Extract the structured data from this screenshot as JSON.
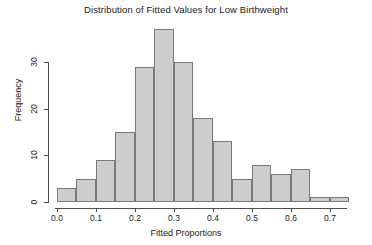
{
  "chart_data": {
    "type": "bar",
    "title": "Distribution of Fitted Values for Low Birthweight",
    "xlabel": "Fitted Proportions",
    "ylabel": "Frequency",
    "xlim": [
      0.0,
      0.7385
    ],
    "ylim": [
      0,
      37
    ],
    "grid": false,
    "legend": null,
    "bin_width": 0.05,
    "bin_edges": [
      0.0,
      0.05,
      0.1,
      0.15,
      0.2,
      0.25,
      0.3,
      0.35,
      0.4,
      0.45,
      0.5,
      0.55,
      0.6,
      0.65,
      0.7,
      0.75
    ],
    "categories": [
      "0.00-0.05",
      "0.05-0.10",
      "0.10-0.15",
      "0.15-0.20",
      "0.20-0.25",
      "0.25-0.30",
      "0.30-0.35",
      "0.35-0.40",
      "0.40-0.45",
      "0.45-0.50",
      "0.50-0.55",
      "0.55-0.60",
      "0.60-0.65",
      "0.65-0.70",
      "0.70-0.75"
    ],
    "values": [
      3,
      5,
      9,
      15,
      29,
      37,
      30,
      18,
      13,
      5,
      8,
      6,
      7,
      1,
      1
    ],
    "xticks": [
      0.0,
      0.1,
      0.2,
      0.3,
      0.4,
      0.5,
      0.6,
      0.7
    ],
    "xtick_labels": [
      "0.0",
      "0.1",
      "0.2",
      "0.3",
      "0.4",
      "0.5",
      "0.6",
      "0.7"
    ],
    "yticks": [
      0,
      10,
      20,
      30
    ],
    "ytick_labels": [
      "0",
      "10",
      "20",
      "30"
    ],
    "bar_fill_color": "#cdcdcd",
    "bar_border_color": "#7a7a7a",
    "axis_color": "#4d4d4d",
    "background_color": "#ffffff"
  }
}
